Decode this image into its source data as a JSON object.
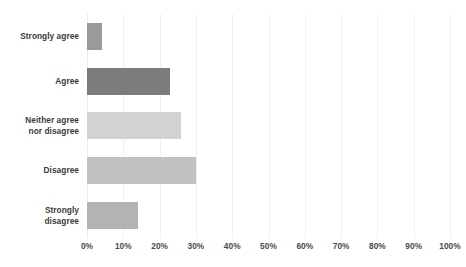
{
  "chart_data": {
    "type": "bar",
    "orientation": "horizontal",
    "title": "",
    "xlabel": "",
    "ylabel": "",
    "categories": [
      "Strongly agree",
      "Agree",
      "Neither agree\nnor disagree",
      "Disagree",
      "Strongly\ndisagree"
    ],
    "values": [
      4,
      23,
      26,
      30,
      14
    ],
    "xlim": [
      0,
      100
    ],
    "xticks": [
      0,
      10,
      20,
      30,
      40,
      50,
      60,
      70,
      80,
      90,
      100
    ],
    "xtick_labels": [
      "0%",
      "10%",
      "20%",
      "30%",
      "40%",
      "50%",
      "60%",
      "70%",
      "80%",
      "90%",
      "100%"
    ],
    "grid": true,
    "legend": "none",
    "bar_colors": [
      "#9a9a9a",
      "#7c7c7c",
      "#d2d2d2",
      "#c2c2c2",
      "#b3b3b3"
    ],
    "background_color": "#ffffff",
    "gridline_color": "#f0f0f0",
    "label_color": "#3b3b3b",
    "tick_color": "#4a4a4a"
  }
}
